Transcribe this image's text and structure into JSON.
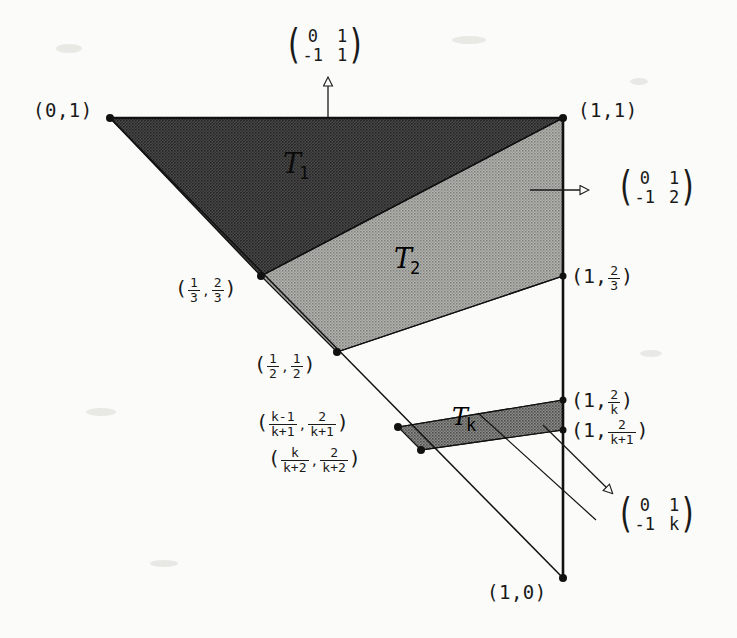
{
  "figure": {
    "background_color": "#fbfbf9",
    "ink_color": "#1a1a1a"
  },
  "vertices": {
    "top_left": "(0,1)",
    "top_right": "(1,1)",
    "bottom_right": "(1,0)"
  },
  "edge_labels": {
    "third_two_thirds": {
      "open": "(",
      "x_num": "1",
      "x_den": "3",
      "comma": ",",
      "y_num": "2",
      "y_den": "3",
      "close": ")"
    },
    "half_half": {
      "open": "(",
      "x_num": "1",
      "x_den": "2",
      "comma": ",",
      "y_num": "1",
      "y_den": "2",
      "close": ")"
    },
    "k_minus_1_over_k_plus_1": {
      "open": "(",
      "x_num": "k-1",
      "x_den": "k+1",
      "comma": ",",
      "y_num": "2",
      "y_den": "k+1",
      "close": ")"
    },
    "k_over_k_plus_2": {
      "open": "(",
      "x_num": "k",
      "x_den": "k+2",
      "comma": ",",
      "y_num": "2",
      "y_den": "k+2",
      "close": ")"
    },
    "one_two_thirds": {
      "open": "(1,",
      "num": "2",
      "den": "3",
      "close": ")"
    },
    "one_two_over_k": {
      "open": "(1,",
      "num": "2",
      "den": "k",
      "close": ")"
    },
    "one_two_over_k_plus_1": {
      "open": "(1,",
      "num": "2",
      "den": "k+1",
      "close": ")"
    }
  },
  "regions": [
    {
      "id": "T1",
      "symbol": "T",
      "subscript": "1",
      "shade": "#3a3a3a"
    },
    {
      "id": "T2",
      "symbol": "T",
      "subscript": "2",
      "shade": "#8d8d8d"
    },
    {
      "id": "Tk",
      "symbol": "T",
      "subscript": "k",
      "shade": "#6d6d6d"
    }
  ],
  "matrices": [
    {
      "id": "top",
      "direction": "up",
      "open": "(",
      "close": ")",
      "cells": [
        "0",
        "1",
        "-1",
        "1"
      ]
    },
    {
      "id": "right",
      "direction": "right",
      "open": "(",
      "close": ")",
      "cells": [
        "0",
        "1",
        "-1",
        "2"
      ]
    },
    {
      "id": "lower_right",
      "direction": "down-right",
      "open": "(",
      "close": ")",
      "cells": [
        "0",
        "1",
        "-1",
        "k"
      ]
    }
  ],
  "geometry": {
    "points": {
      "p01": [
        110,
        118
      ],
      "p11": [
        563,
        118
      ],
      "p10": [
        563,
        578
      ],
      "p13_23": [
        261,
        276
      ],
      "p12_12": [
        337,
        352
      ],
      "p1_23": [
        563,
        276
      ],
      "p1_2k": [
        563,
        400
      ],
      "p1_2k1": [
        563,
        430
      ],
      "pk1": [
        398,
        427
      ],
      "pk2": [
        421,
        450
      ]
    }
  }
}
